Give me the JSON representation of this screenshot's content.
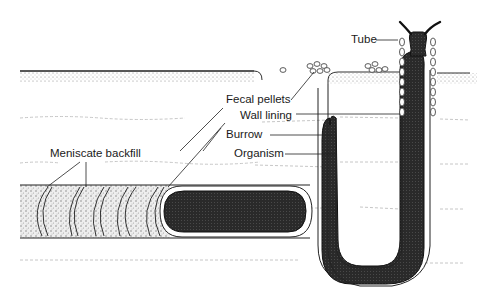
{
  "diagram": {
    "colors": {
      "background": "#ffffff",
      "ink": "#1a1a1a",
      "organism_fill": "#2a2a2a",
      "sediment_stipple": "#9a9a9a"
    },
    "labels": {
      "tube": "Tube",
      "fecal_pellets": "Fecal pellets",
      "wall_lining": "Wall lining",
      "burrow": "Burrow",
      "organism": "Organism",
      "meniscate_backfill": "Meniscate backfill"
    },
    "components": [
      {
        "id": "surface",
        "name": "Sediment surface"
      },
      {
        "id": "horizontal-burrow",
        "name": "Horizontal burrow with meniscate backfill and organism"
      },
      {
        "id": "u-burrow",
        "name": "U-shaped burrow with wall lining, fecal pellets and organism"
      },
      {
        "id": "tube",
        "name": "Vertical tube with lined walls and protruding organism"
      }
    ]
  }
}
